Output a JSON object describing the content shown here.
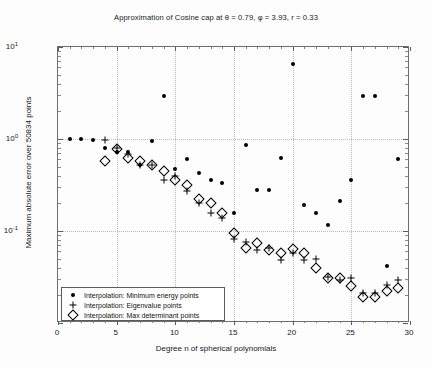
{
  "chart_data": {
    "type": "scatter",
    "title": "Approximation of Cosine cap at θ = 0.79, φ = 3.93, r = 0.33",
    "xlabel": "Degree n of spherical polynomials",
    "ylabel": "Maximum absolute error over 50834 points",
    "xlim": [
      0,
      30
    ],
    "ylim": [
      0.01,
      10
    ],
    "yscale": "log",
    "xscale": "linear",
    "grid": true,
    "legend_position": "lower left",
    "xticks": [
      0,
      5,
      10,
      15,
      20,
      25,
      30
    ],
    "xticklabels": [
      "0",
      "5",
      "10",
      "15",
      "20",
      "25",
      "30"
    ],
    "yticks": [
      0.1,
      1,
      10
    ],
    "yticklabels": [
      "10⁻¹",
      "10⁰",
      "10¹"
    ],
    "series": [
      {
        "name": "Interpolation: Minimum energy points",
        "marker": "dot",
        "color": "#000000",
        "points": [
          [
            1,
            1.0
          ],
          [
            2,
            1.0
          ],
          [
            3,
            0.98
          ],
          [
            4,
            0.79
          ],
          [
            5,
            0.72
          ],
          [
            6,
            0.72
          ],
          [
            7,
            0.52
          ],
          [
            8,
            0.96
          ],
          [
            9,
            2.9
          ],
          [
            10,
            0.47
          ],
          [
            11,
            0.6
          ],
          [
            12,
            0.43
          ],
          [
            13,
            0.36
          ],
          [
            14,
            0.33
          ],
          [
            15,
            0.155
          ],
          [
            16,
            0.86
          ],
          [
            17,
            0.28
          ],
          [
            18,
            0.28
          ],
          [
            19,
            0.62
          ],
          [
            20,
            6.6
          ],
          [
            21,
            0.19
          ],
          [
            22,
            0.155
          ],
          [
            23,
            0.115
          ],
          [
            24,
            0.21
          ],
          [
            25,
            0.36
          ],
          [
            26,
            2.9
          ],
          [
            27,
            2.9
          ],
          [
            28,
            0.042
          ],
          [
            29,
            0.6
          ]
        ]
      },
      {
        "name": "Interpolation: Eigenvalue points",
        "marker": "plus",
        "color": "#000000",
        "points": [
          [
            4,
            0.98
          ],
          [
            5,
            0.8
          ],
          [
            6,
            0.68
          ],
          [
            7,
            0.52
          ],
          [
            8,
            0.52
          ],
          [
            9,
            0.36
          ],
          [
            10,
            0.4
          ],
          [
            11,
            0.27
          ],
          [
            12,
            0.2
          ],
          [
            13,
            0.155
          ],
          [
            14,
            0.14
          ],
          [
            15,
            0.082
          ],
          [
            16,
            0.075
          ],
          [
            17,
            0.062
          ],
          [
            18,
            0.066
          ],
          [
            19,
            0.049
          ],
          [
            20,
            0.058
          ],
          [
            21,
            0.048
          ],
          [
            22,
            0.05
          ],
          [
            23,
            0.032
          ],
          [
            24,
            0.029
          ],
          [
            25,
            0.031
          ],
          [
            26,
            0.021
          ],
          [
            27,
            0.021
          ],
          [
            28,
            0.026
          ],
          [
            29,
            0.029
          ]
        ]
      },
      {
        "name": "Interpolation: Max determinant points",
        "marker": "diamond",
        "color": "#000000",
        "points": [
          [
            4,
            0.58
          ],
          [
            5,
            0.78
          ],
          [
            6,
            0.62
          ],
          [
            7,
            0.58
          ],
          [
            8,
            0.52
          ],
          [
            9,
            0.45
          ],
          [
            10,
            0.36
          ],
          [
            11,
            0.32
          ],
          [
            12,
            0.22
          ],
          [
            13,
            0.2
          ],
          [
            14,
            0.155
          ],
          [
            15,
            0.095
          ],
          [
            16,
            0.066
          ],
          [
            17,
            0.074
          ],
          [
            18,
            0.062
          ],
          [
            19,
            0.058
          ],
          [
            20,
            0.064
          ],
          [
            21,
            0.058
          ],
          [
            22,
            0.04
          ],
          [
            23,
            0.031
          ],
          [
            24,
            0.031
          ],
          [
            25,
            0.025
          ],
          [
            26,
            0.019
          ],
          [
            27,
            0.019
          ],
          [
            28,
            0.022
          ],
          [
            29,
            0.024
          ]
        ]
      }
    ]
  },
  "axis": {
    "x_title": "Degree n of spherical polynomials",
    "y_title": "Maximum absolute error over 50834 points"
  },
  "title": {
    "text": "Approximation of Cosine cap at θ = 0.79, φ = 3.93, r = 0.33"
  },
  "legend": {
    "items": [
      {
        "label": "Interpolation: Minimum energy points",
        "marker": "dot"
      },
      {
        "label": "Interpolation: Eigenvalue points",
        "marker": "plus"
      },
      {
        "label": "Interpolation: Max determinant points",
        "marker": "diamond"
      }
    ]
  }
}
